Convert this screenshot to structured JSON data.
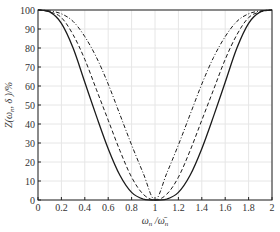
{
  "chart_data": {
    "type": "line",
    "title": "",
    "xlabel": "ω_n / ω̄_n",
    "ylabel": "Z(ω_n, δ)/%",
    "xlim": [
      0,
      2
    ],
    "ylim": [
      0,
      100
    ],
    "grid": true,
    "legend": null,
    "x_ticks": [
      "0",
      "0.2",
      "0.4",
      "0.6",
      "0.8",
      "1",
      "1.2",
      "1.4",
      "1.6",
      "1.8",
      "2"
    ],
    "y_ticks": [
      "0",
      "10",
      "20",
      "30",
      "40",
      "50",
      "60",
      "70",
      "80",
      "90",
      "100"
    ],
    "x": [
      0,
      0.1,
      0.2,
      0.3,
      0.4,
      0.5,
      0.6,
      0.7,
      0.8,
      0.9,
      1.0,
      1.1,
      1.2,
      1.3,
      1.4,
      1.5,
      1.6,
      1.7,
      1.8,
      1.9,
      2.0
    ],
    "series": [
      {
        "name": "solid",
        "style": "solid",
        "values": [
          100,
          99,
          93,
          80,
          62,
          44,
          27,
          13,
          4,
          0.5,
          0,
          0.5,
          4,
          13,
          27,
          44,
          62,
          80,
          93,
          99,
          100
        ]
      },
      {
        "name": "dashed",
        "style": "dashed",
        "values": [
          100,
          99,
          96,
          87,
          74,
          58,
          42,
          26,
          12,
          3,
          0,
          3,
          12,
          26,
          42,
          58,
          74,
          87,
          96,
          99,
          100
        ]
      },
      {
        "name": "dash-dot",
        "style": "dashdot",
        "values": [
          100,
          99.5,
          98,
          94,
          86,
          75,
          61,
          45,
          29,
          14,
          0,
          14,
          29,
          45,
          61,
          75,
          86,
          94,
          98,
          99.5,
          100
        ]
      }
    ]
  },
  "labels": {
    "xlabel_main": "ω",
    "xlabel_sub1": "n",
    "xlabel_sep": " /",
    "xlabel_bar": "ω̄",
    "xlabel_sub2": "n",
    "ylabel_text": "Z(ω",
    "ylabel_sub": "n",
    "ylabel_rest": ", δ )/%"
  }
}
